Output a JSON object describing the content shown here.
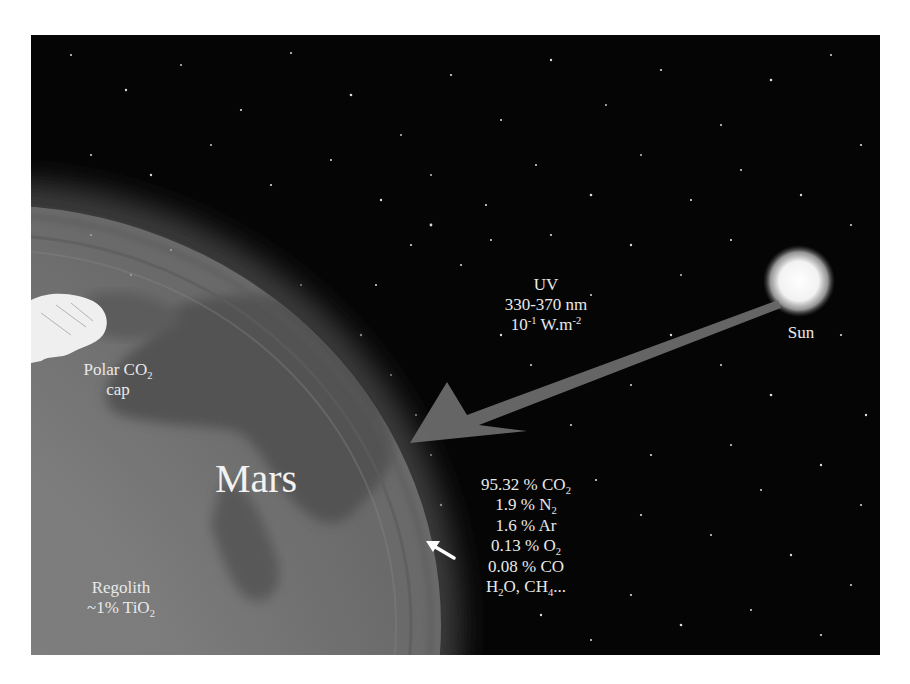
{
  "figure": {
    "colors": {
      "background": "#050505",
      "mars_surface": "#7a7a7a",
      "mars_dark_albedo": "#4f4f4f",
      "uv_arrow": "#6a6a6a",
      "sun": "#f5f5f5",
      "text": "#e9e9e9"
    }
  },
  "labels": {
    "uv": {
      "line1": "UV",
      "line2": "330-370 nm",
      "line3_base": "10",
      "line3_exp1": "-1",
      "line3_unit": " W.m",
      "line3_exp2": "-2"
    },
    "sun": "Sun",
    "polar_cap": {
      "line1_prefix": "Polar CO",
      "line1_sub": "2",
      "line2": "cap"
    },
    "planet": "Mars",
    "regolith": {
      "line1": "Regolith",
      "line2_prefix": "~1% TiO",
      "line2_sub": "2"
    },
    "atmosphere": [
      {
        "value": "95.32 %",
        "species": "CO",
        "sub": "2"
      },
      {
        "value": "1.9 %",
        "species": "N",
        "sub": "2"
      },
      {
        "value": "1.6 %",
        "species": "Ar",
        "sub": ""
      },
      {
        "value": "0.13 %",
        "species": "O",
        "sub": "2"
      },
      {
        "value": "0.08 %",
        "species": "CO",
        "sub": ""
      }
    ],
    "atmosphere_trace": {
      "a": "H",
      "a_sub": "2",
      "b": "O, CH",
      "b_sub": "4",
      "c": "..."
    }
  }
}
